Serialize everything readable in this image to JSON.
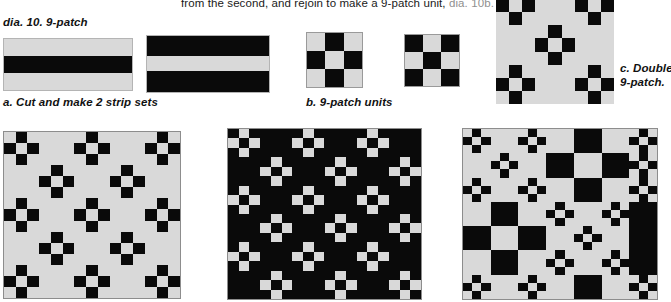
{
  "page": {
    "width": 671,
    "height": 302,
    "background": "#ffffff"
  },
  "colors": {
    "light": "#d9d9d9",
    "dark": "#0a0a0a",
    "text": "#111111",
    "muted_text": "#8f8f8f",
    "border": "#9a9a9a"
  },
  "top_text": {
    "line": "from the second, and rejoin to make a 9-patch unit,",
    "reference": "dia. 10b."
  },
  "figure_title": "dia. 10. 9-patch",
  "captions": {
    "a": "a. Cut and make 2 strip sets",
    "b": "b. 9-patch units",
    "c_line1": "c. Double",
    "c_line2": "9-patch."
  },
  "strip_sets": [
    {
      "name": "strip-set-1",
      "bands": [
        "light",
        "dark",
        "light"
      ],
      "band_fractions": [
        0.33,
        0.34,
        0.33
      ]
    },
    {
      "name": "strip-set-2",
      "bands": [
        "dark",
        "light",
        "dark"
      ],
      "band_fractions": [
        0.36,
        0.26,
        0.38
      ]
    }
  ],
  "nine_patch_units": [
    {
      "name": "nine-patch-light-corners",
      "cells": [
        [
          "light",
          "dark",
          "light"
        ],
        [
          "dark",
          "light",
          "dark"
        ],
        [
          "light",
          "dark",
          "light"
        ]
      ]
    },
    {
      "name": "nine-patch-dark-corners",
      "cells": [
        [
          "dark",
          "light",
          "dark"
        ],
        [
          "light",
          "dark",
          "light"
        ],
        [
          "dark",
          "light",
          "dark"
        ]
      ]
    }
  ],
  "double_nine_patch": {
    "name": "double-nine-patch",
    "layout": [
      [
        "unit-light",
        "plain-light",
        "unit-light"
      ],
      [
        "plain-light",
        "unit-light",
        "plain-light"
      ],
      [
        "unit-light",
        "plain-light",
        "unit-light"
      ]
    ]
  },
  "quilts": [
    {
      "name": "quilt-left",
      "size": 5,
      "background": "light",
      "layout": [
        [
          "unit-light",
          "plain-light",
          "unit-light",
          "plain-light",
          "unit-light"
        ],
        [
          "plain-light",
          "unit-light",
          "plain-light",
          "unit-light",
          "plain-light"
        ],
        [
          "unit-light",
          "plain-light",
          "unit-light",
          "plain-light",
          "unit-light"
        ],
        [
          "plain-light",
          "unit-light",
          "plain-light",
          "unit-light",
          "plain-light"
        ],
        [
          "unit-light",
          "plain-light",
          "unit-light",
          "plain-light",
          "unit-light"
        ]
      ]
    },
    {
      "name": "quilt-center",
      "size": 6,
      "background": "dark",
      "layout": [
        [
          "unit-dark",
          "plain-dark",
          "unit-dark",
          "plain-dark",
          "unit-dark",
          "plain-dark"
        ],
        [
          "plain-dark",
          "unit-dark",
          "plain-dark",
          "unit-dark",
          "plain-dark",
          "unit-dark"
        ],
        [
          "unit-dark",
          "plain-dark",
          "unit-dark",
          "plain-dark",
          "unit-dark",
          "plain-dark"
        ],
        [
          "plain-dark",
          "unit-dark",
          "plain-dark",
          "unit-dark",
          "plain-dark",
          "unit-dark"
        ],
        [
          "unit-dark",
          "plain-dark",
          "unit-dark",
          "plain-dark",
          "unit-dark",
          "plain-dark"
        ],
        [
          "plain-dark",
          "unit-dark",
          "plain-dark",
          "unit-dark",
          "plain-dark",
          "unit-dark"
        ]
      ]
    },
    {
      "name": "quilt-right",
      "size": 7,
      "background": "mixed",
      "layout": [
        [
          "unit-light",
          "plain-light",
          "unit-light",
          "plain-light",
          "plain-dark",
          "plain-light",
          "unit-light"
        ],
        [
          "plain-light",
          "unit-light",
          "plain-light",
          "plain-dark",
          "plain-light",
          "plain-dark",
          "unit-light"
        ],
        [
          "unit-light",
          "plain-light",
          "unit-light",
          "plain-light",
          "plain-dark",
          "plain-light",
          "unit-light"
        ],
        [
          "plain-light",
          "plain-dark",
          "plain-light",
          "unit-light",
          "plain-light",
          "unit-light",
          "plain-dark"
        ],
        [
          "plain-dark",
          "plain-light",
          "plain-dark",
          "plain-light",
          "unit-light",
          "plain-light",
          "plain-dark"
        ],
        [
          "plain-light",
          "plain-dark",
          "plain-light",
          "unit-light",
          "plain-light",
          "unit-light",
          "plain-dark"
        ],
        [
          "unit-light",
          "plain-light",
          "unit-light",
          "plain-light",
          "plain-dark",
          "plain-light",
          "unit-light"
        ]
      ]
    }
  ]
}
